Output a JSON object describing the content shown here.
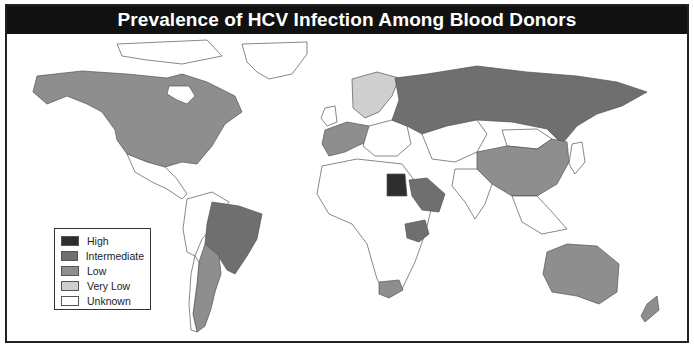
{
  "title": "Prevalence of HCV Infection Among Blood Donors",
  "colors": {
    "high": "#2e2e2e",
    "intermediate": "#6f6f6f",
    "low": "#8e8e8e",
    "very_low": "#cfcfcf",
    "unknown": "#ffffff",
    "border": "#555555",
    "title_bg": "#111111"
  },
  "legend": {
    "items": [
      {
        "label": "High",
        "color": "#2e2e2e"
      },
      {
        "label": "Intermediate",
        "color": "#6f6f6f"
      },
      {
        "label": "Low",
        "color": "#8e8e8e"
      },
      {
        "label": "Very Low",
        "color": "#cfcfcf"
      },
      {
        "label": "Unknown",
        "color": "#ffffff"
      }
    ]
  },
  "regions": [
    {
      "name": "North America (USA, Canada)",
      "category": "Low"
    },
    {
      "name": "Brazil",
      "category": "Intermediate"
    },
    {
      "name": "Argentina",
      "category": "Low"
    },
    {
      "name": "Western Europe",
      "category": "Low"
    },
    {
      "name": "Scandinavia",
      "category": "Very Low"
    },
    {
      "name": "Russia",
      "category": "Intermediate"
    },
    {
      "name": "China",
      "category": "Low"
    },
    {
      "name": "Egypt",
      "category": "High"
    },
    {
      "name": "Saudi Arabia",
      "category": "Intermediate"
    },
    {
      "name": "Ethiopia",
      "category": "Intermediate"
    },
    {
      "name": "South Africa",
      "category": "Low"
    },
    {
      "name": "Australia",
      "category": "Low"
    },
    {
      "name": "New Zealand",
      "category": "Low"
    }
  ]
}
